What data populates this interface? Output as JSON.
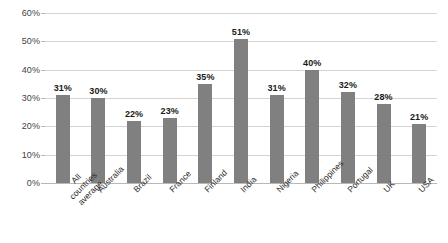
{
  "chart_data": {
    "type": "bar",
    "title": "",
    "subtitle": "",
    "xlabel": "",
    "ylabel": "",
    "ylim": [
      0,
      60
    ],
    "ytick_labels": [
      "0%",
      "10%",
      "20%",
      "30%",
      "40%",
      "50%",
      "60%"
    ],
    "ytick_values": [
      0,
      10,
      20,
      30,
      40,
      50,
      60
    ],
    "grid": true,
    "legend": false,
    "legend_position": "none",
    "bar_color": "#808080",
    "gridline_color": "#d4d4d4",
    "axis_color": "#b8b8b8",
    "label_color": "#1a1a1a",
    "categories": [
      "All countries\naverage",
      "Australia",
      "Brazil",
      "France",
      "Finland",
      "India",
      "Nigeria",
      "Philippines",
      "Portugal",
      "UK",
      "USA"
    ],
    "values": [
      31,
      30,
      22,
      23,
      35,
      51,
      31,
      40,
      32,
      28,
      21
    ],
    "data_labels": [
      "31%",
      "30%",
      "22%",
      "23%",
      "35%",
      "51%",
      "31%",
      "40%",
      "32%",
      "28%",
      "21%"
    ]
  }
}
